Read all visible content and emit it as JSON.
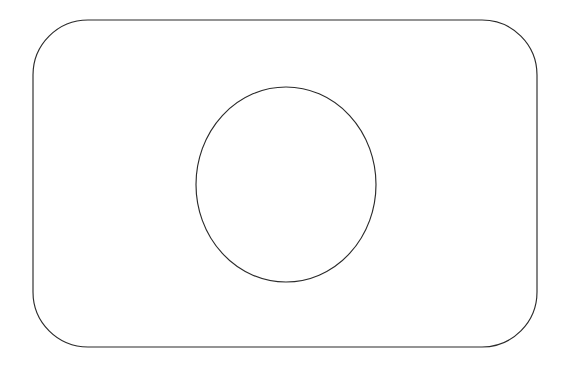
{
  "canvas": {
    "width": 586,
    "height": 372,
    "background_color": "#ffffff",
    "stroke_color": "#2b2b2b",
    "stroke_width": 1.15,
    "description": "Line drawing of a rounded rectangle containing a circle"
  },
  "shapes": {
    "outer": {
      "name": "rounded-rectangle",
      "type": "rounded-rect",
      "x": 33,
      "y": 20,
      "width": 504,
      "height": 327,
      "corner_radius": 55,
      "fill": "none",
      "stroke_color": "#2b2b2b"
    },
    "inner": {
      "name": "circle",
      "type": "ellipse",
      "center_x": 286,
      "center_y": 184.5,
      "radius_x": 90,
      "radius_y": 97.5,
      "fill": "none",
      "stroke_color": "#2b2b2b"
    }
  },
  "chart_data": {
    "type": "diagram",
    "title": "",
    "elements": [
      {
        "shape": "rounded_rectangle",
        "left": 33,
        "top": 20,
        "right": 537,
        "bottom": 347,
        "corner_radius": 55
      },
      {
        "shape": "circle",
        "left": 196,
        "top": 87,
        "right": 376,
        "bottom": 282,
        "center": [
          286,
          184.5
        ],
        "radius": [
          90,
          97.5
        ]
      }
    ],
    "annotations": [],
    "legend": [],
    "grid": false
  }
}
